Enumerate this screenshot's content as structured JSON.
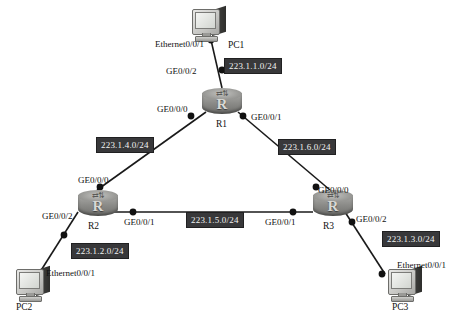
{
  "diagram": {
    "background_color": "#ffffff",
    "line_color": "#1a1a1a",
    "badge_background": "#38383a",
    "badge_text_color": "#f2f2f2",
    "router_letter": "R"
  },
  "nodes": [
    {
      "id": "pc1",
      "type": "pc",
      "name": "PC1",
      "x": 190,
      "y": 6
    },
    {
      "id": "r1",
      "type": "router",
      "name": "R1",
      "x": 202,
      "y": 88
    },
    {
      "id": "r2",
      "type": "router",
      "name": "R2",
      "x": 78,
      "y": 190
    },
    {
      "id": "r3",
      "type": "router",
      "name": "R3",
      "x": 313,
      "y": 190
    },
    {
      "id": "pc2",
      "type": "pc",
      "name": "PC2",
      "x": 14,
      "y": 266
    },
    {
      "id": "pc3",
      "type": "pc",
      "name": "PC3",
      "x": 386,
      "y": 266
    }
  ],
  "node_name_labels": [
    {
      "text": "PC1",
      "x": 228,
      "y": 40
    },
    {
      "text": "R1",
      "x": 216,
      "y": 119
    },
    {
      "text": "R2",
      "x": 88,
      "y": 221
    },
    {
      "text": "R3",
      "x": 323,
      "y": 221
    },
    {
      "text": "PC2",
      "x": 16,
      "y": 302
    },
    {
      "text": "PC3",
      "x": 392,
      "y": 302
    }
  ],
  "links": [
    {
      "from": "pc1",
      "to": "r1",
      "x1": 211,
      "y1": 40,
      "x2": 222,
      "y2": 88,
      "subnet": "223.1.1.0/24"
    },
    {
      "from": "r1",
      "to": "r2",
      "x1": 206,
      "y1": 112,
      "x2": 97,
      "y2": 190,
      "subnet": "223.1.4.0/24"
    },
    {
      "from": "r1",
      "to": "r3",
      "x1": 238,
      "y1": 112,
      "x2": 330,
      "y2": 190,
      "subnet": "223.1.6.0/24"
    },
    {
      "from": "r2",
      "to": "r3",
      "x1": 112,
      "y1": 212,
      "x2": 313,
      "y2": 212,
      "subnet": "223.1.5.0/24"
    },
    {
      "from": "r2",
      "to": "pc2",
      "x1": 78,
      "y1": 212,
      "x2": 40,
      "y2": 272,
      "subnet": "223.1.2.0/24"
    },
    {
      "from": "r3",
      "to": "pc3",
      "x1": 345,
      "y1": 212,
      "x2": 385,
      "y2": 274,
      "subnet": "223.1.3.0/24"
    }
  ],
  "connection_dots": [
    {
      "name": "pc1-nic-dot",
      "x": 211,
      "y": 40
    },
    {
      "name": "r1-ge002-dot",
      "x": 222,
      "y": 70
    },
    {
      "name": "r1-ge000-dot",
      "x": 191,
      "y": 116
    },
    {
      "name": "r1-ge001-dot",
      "x": 243,
      "y": 116
    },
    {
      "name": "r2-ge000-dot",
      "x": 100,
      "y": 187
    },
    {
      "name": "r2-ge001-dot",
      "x": 133,
      "y": 212
    },
    {
      "name": "r2-ge002-dot",
      "x": 64,
      "y": 235
    },
    {
      "name": "r3-ge000-dot",
      "x": 316,
      "y": 187
    },
    {
      "name": "r3-ge001-dot",
      "x": 293,
      "y": 212
    },
    {
      "name": "r3-ge002-dot",
      "x": 352,
      "y": 222
    },
    {
      "name": "pc2-nic-dot",
      "x": 43,
      "y": 272
    },
    {
      "name": "pc3-nic-dot",
      "x": 382,
      "y": 274
    }
  ],
  "interface_labels": [
    {
      "name": "pc1-interface",
      "text": "Ethernet0/0/1",
      "x": 155,
      "y": 39
    },
    {
      "name": "r1-ge002-label",
      "text": "GE0/0/2",
      "x": 166,
      "y": 66
    },
    {
      "name": "r1-ge000-label",
      "text": "GE0/0/0",
      "x": 157,
      "y": 104
    },
    {
      "name": "r1-ge001-label",
      "text": "GE0/0/1",
      "x": 251,
      "y": 112
    },
    {
      "name": "r2-ge000-label",
      "text": "GE0/0/0",
      "x": 78,
      "y": 175
    },
    {
      "name": "r2-ge001-label",
      "text": "GE0/0/1",
      "x": 124,
      "y": 217
    },
    {
      "name": "r2-ge002-label",
      "text": "GE0/0/2",
      "x": 42,
      "y": 211
    },
    {
      "name": "pc2-interface",
      "text": "Ethernet0/0/1",
      "x": 46,
      "y": 268
    },
    {
      "name": "r3-ge000-label",
      "text": "GE0/0/0",
      "x": 318,
      "y": 185
    },
    {
      "name": "r3-ge001-label",
      "text": "GE0/0/1",
      "x": 265,
      "y": 217
    },
    {
      "name": "r3-ge002-label",
      "text": "GE0/0/2",
      "x": 356,
      "y": 214
    },
    {
      "name": "pc3-interface",
      "text": "Ethernet0/0/1",
      "x": 397,
      "y": 260
    }
  ],
  "subnet_badges": [
    {
      "name": "subnet-223-1-1",
      "text": "223.1.1.0/24",
      "x": 224,
      "y": 58
    },
    {
      "name": "subnet-223-1-4",
      "text": "223.1.4.0/24",
      "x": 96,
      "y": 137
    },
    {
      "name": "subnet-223-1-6",
      "text": "223.1.6.0/24",
      "x": 278,
      "y": 139
    },
    {
      "name": "subnet-223-1-5",
      "text": "223.1.5.0/24",
      "x": 186,
      "y": 212
    },
    {
      "name": "subnet-223-1-2",
      "text": "223.1.2.0/24",
      "x": 71,
      "y": 243
    },
    {
      "name": "subnet-223-1-3",
      "text": "223.1.3.0/24",
      "x": 382,
      "y": 231
    }
  ]
}
